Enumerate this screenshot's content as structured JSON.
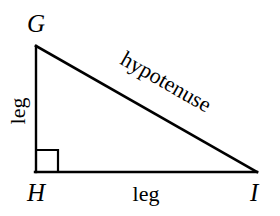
{
  "figure": {
    "type": "right-triangle-diagram",
    "background_color": "#ffffff",
    "stroke_color": "#000000",
    "stroke_width": 2
  },
  "vertices": [
    {
      "label": "G",
      "x": 36,
      "y": 46,
      "position": "top-left"
    },
    {
      "label": "H",
      "x": 36,
      "y": 172,
      "position": "bottom-left"
    },
    {
      "label": "I",
      "x": 256,
      "y": 172,
      "position": "bottom-right"
    }
  ],
  "sides": [
    {
      "name": "vertical-leg",
      "label": "leg",
      "from": "G",
      "to": "H",
      "orientation": "vertical",
      "rotation_deg": -90
    },
    {
      "name": "horizontal-leg",
      "label": "leg",
      "from": "H",
      "to": "I",
      "orientation": "horizontal",
      "rotation_deg": 0
    },
    {
      "name": "hypotenuse",
      "label": "hypotenuse",
      "from": "G",
      "to": "I",
      "orientation": "diagonal",
      "rotation_deg": 29.8
    }
  ],
  "right_angle": {
    "at_vertex": "H",
    "marker": "square",
    "size": 22
  }
}
